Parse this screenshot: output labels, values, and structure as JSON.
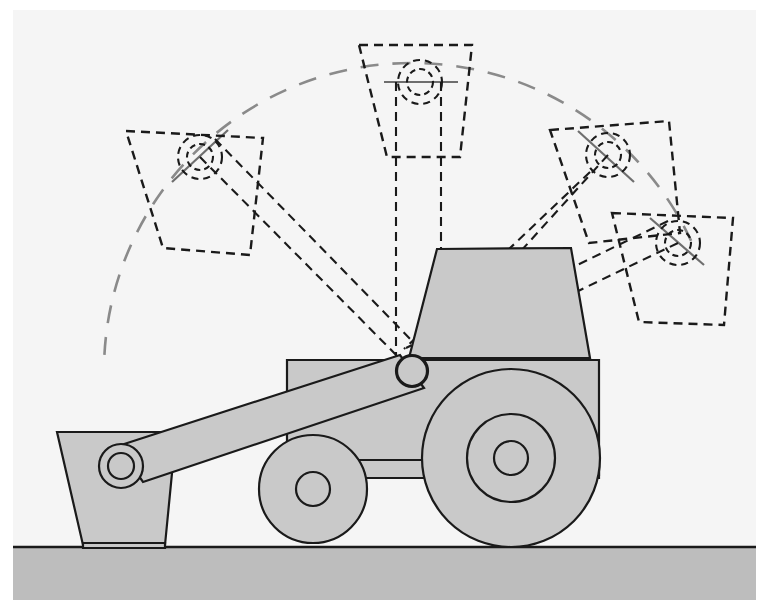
{
  "diagram": {
    "title": "Wheel loader boom lift kinematics side view",
    "canvas": {
      "width": 769,
      "height": 616
    },
    "colors": {
      "background": "#f5f5f5",
      "outer_border": "#ffffff",
      "fill_body": "#c9c9c9",
      "fill_ground": "#bdbdbd",
      "stroke_solid": "#1a1a1a",
      "stroke_dashed": "#1a1a1a",
      "stroke_arc": "#8a8a8a",
      "stroke_tick": "#6e6e6e"
    },
    "ground": {
      "label": "ground-line",
      "y": 547,
      "band_top": 547,
      "band_bottom": 600
    },
    "pivot": {
      "label": "boom-pivot",
      "x": 412,
      "y": 371,
      "hub_radius": 16,
      "bore_radius": 15
    },
    "trajectory_arc": {
      "label": "bucket-pivot-trajectory",
      "center_x": 412,
      "center_y": 371,
      "radius": 308,
      "start_angle_deg": 183,
      "end_angle_deg": 335,
      "dash": "18 14"
    },
    "machine": {
      "body": {
        "label": "chassis-body",
        "points": "287,360 599,360 599,475 287,475"
      },
      "chassis_bar": {
        "label": "axle-bar",
        "points": "287,460 599,460 599,478 287,478"
      },
      "cab": {
        "label": "operator-cab",
        "points": "437,249 571,248 590,358 409,358"
      },
      "rear_wheel": {
        "label": "rear-wheel",
        "cx": 511,
        "cy": 458,
        "r_outer": 89,
        "r_mid": 44,
        "r_hub": 17
      },
      "front_wheel": {
        "label": "front-wheel",
        "cx": 313,
        "cy": 489,
        "r_outer": 54,
        "r_hub": 17
      },
      "boom_arm": {
        "label": "boom-arm-solid",
        "points": "118,446 400,355 424,388 143,482"
      },
      "boom_end_hub": {
        "label": "boom-end-hub",
        "cx": 121,
        "cy": 466,
        "r_outer": 22,
        "r_inner": 13
      },
      "bucket": {
        "label": "bucket-solid",
        "points": "57,432 176,432 165,545 83,545",
        "lip": "83,543 165,543 165,548 83,548"
      }
    },
    "phantom_positions": [
      {
        "label": "phantom-bucket-left",
        "index": 1,
        "pivot": {
          "x": 200,
          "y": 157
        },
        "bucket_points": "126,131 263,138 250,255 163,248",
        "hub_r_outer": 22,
        "hub_r_inner": 13,
        "arm": [
          {
            "x1": 200,
            "y1": 157,
            "x2": 412,
            "y2": 371
          },
          {
            "x1": 215,
            "y1": 139,
            "x2": 420,
            "y2": 349
          }
        ],
        "tick": {
          "x1": 172,
          "y1": 182,
          "x2": 228,
          "y2": 130
        }
      },
      {
        "label": "phantom-bucket-top",
        "index": 2,
        "pivot": {
          "x": 420,
          "y": 82
        },
        "bucket_points": "359,45 472,45 460,157 387,157",
        "hub_r_outer": 22,
        "hub_r_inner": 13,
        "arm": [
          {
            "x1": 396,
            "y1": 82,
            "x2": 396,
            "y2": 371
          },
          {
            "x1": 441,
            "y1": 82,
            "x2": 441,
            "y2": 371
          }
        ],
        "tick": {
          "x1": 384,
          "y1": 82,
          "x2": 458,
          "y2": 82
        }
      },
      {
        "label": "phantom-bucket-right-upper",
        "index": 3,
        "pivot": {
          "x": 608,
          "y": 155
        },
        "bucket_points": "550,130 669,121 680,233 589,243",
        "hub_r_outer": 22,
        "hub_r_inner": 13,
        "arm": [
          {
            "x1": 608,
            "y1": 155,
            "x2": 412,
            "y2": 371
          },
          {
            "x1": 590,
            "y1": 172,
            "x2": 404,
            "y2": 349
          }
        ],
        "tick": {
          "x1": 578,
          "y1": 131,
          "x2": 634,
          "y2": 182
        }
      },
      {
        "label": "phantom-bucket-right-lower",
        "index": 4,
        "pivot": {
          "x": 678,
          "y": 243
        },
        "bucket_points": "612,213 733,218 724,325 639,322",
        "hub_r_outer": 22,
        "hub_r_inner": 13,
        "arm": [
          {
            "x1": 678,
            "y1": 243,
            "x2": 412,
            "y2": 371
          },
          {
            "x1": 668,
            "y1": 221,
            "x2": 406,
            "y2": 348
          }
        ],
        "tick": {
          "x1": 650,
          "y1": 218,
          "x2": 704,
          "y2": 265
        }
      }
    ],
    "arc_ticks": [
      {
        "label": "arc-tick-left",
        "x1": 172,
        "y1": 182,
        "x2": 228,
        "y2": 130
      },
      {
        "label": "arc-tick-top",
        "x1": 384,
        "y1": 82,
        "x2": 458,
        "y2": 82
      },
      {
        "label": "arc-tick-right",
        "x1": 578,
        "y1": 131,
        "x2": 634,
        "y2": 182
      },
      {
        "label": "arc-tick-far",
        "x1": 650,
        "y1": 218,
        "x2": 704,
        "y2": 265
      }
    ]
  }
}
